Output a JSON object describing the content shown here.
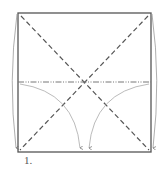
{
  "diagram": {
    "type": "origami-fold-step",
    "step_label": "1.",
    "colors": {
      "paper_edge": "#555555",
      "valley_fold": "#555555",
      "mountain_fold": "#777777",
      "arrow": "#999999",
      "background": "#ffffff"
    },
    "elements": {
      "square": "paper outline",
      "diagonals": "two valley-fold diagonals (dashed)",
      "horizontal": "mountain-fold line at center (dash-dot-dot)",
      "arrows": [
        "left edge curved arrow",
        "right edge curved arrow",
        "left inner fold arrow",
        "right inner fold arrow"
      ]
    }
  }
}
